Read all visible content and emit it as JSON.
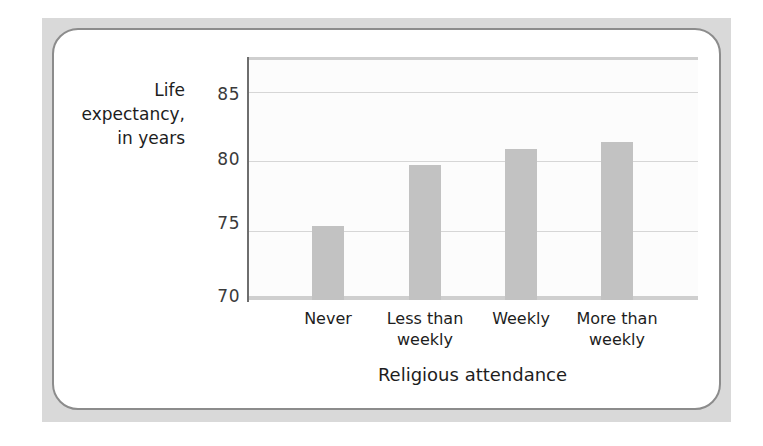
{
  "figure": {
    "card_border_color": "#8c8c8c",
    "panel_background": "#d9d9d9"
  },
  "chart_data": {
    "type": "bar",
    "title": "",
    "subtitle": "",
    "xlabel": "Religious attendance",
    "ylabel": "Life expectancy, in years",
    "ylabel_lines": [
      "Life",
      "expectancy,",
      "in years"
    ],
    "categories": [
      "Never",
      "Less than weekly",
      "Weekly",
      "More than weekly"
    ],
    "category_lines": [
      [
        "Never"
      ],
      [
        "Less than",
        "weekly"
      ],
      [
        "Weekly"
      ],
      [
        "More than",
        "weekly"
      ]
    ],
    "values": [
      75.3,
      79.7,
      80.9,
      81.4
    ],
    "ylim": [
      70,
      87.5
    ],
    "yticks": [
      70,
      75,
      80,
      85
    ],
    "ytick_labels": [
      "70",
      "75",
      "80",
      "85"
    ],
    "gridlines": [
      75,
      80,
      85
    ],
    "grid": true,
    "legend": null,
    "bar_color": "#c2c2c2",
    "gridline_color": "#d6d6d6",
    "axis_color": "#6e6e6e",
    "plot_background": "#fcfcfc"
  }
}
